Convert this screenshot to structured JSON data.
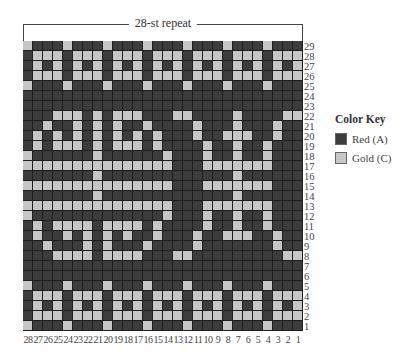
{
  "title": "28-st repeat",
  "colors": {
    "D": "#3c3c3c",
    "L": "#c6c6c6"
  },
  "key": {
    "title": "Color Key",
    "items": [
      {
        "code": "D",
        "label": "Red (A)",
        "color": "#3c3c3c"
      },
      {
        "code": "L",
        "label": "Gold (C)",
        "color": "#c6c6c6"
      }
    ]
  },
  "column_labels": [
    "28",
    "27",
    "26",
    "25",
    "24",
    "23",
    "22",
    "21",
    "20",
    "19",
    "18",
    "17",
    "16",
    "15",
    "14",
    "13",
    "12",
    "11",
    "10",
    "9",
    "8",
    "7",
    "6",
    "5",
    "4",
    "3",
    "2",
    "1"
  ],
  "rows": [
    {
      "num": "29",
      "cells": "LDDDLDDDLDDDLDDDLDDDLDDDLDDD"
    },
    {
      "num": "28",
      "cells": "DLLLDLLLDLLLDLLLDLLLDLLLDLLL"
    },
    {
      "num": "27",
      "cells": "DLDLDLDLDLDLDLDLDLDLDLDLDLDL"
    },
    {
      "num": "26",
      "cells": "DLLLDLLLDLLLDLLLDLLLDLLLDLLL"
    },
    {
      "num": "25",
      "cells": "LDDDLDDDLDDDLDDDLDDDLDDDLDDD"
    },
    {
      "num": "24",
      "cells": "DDDDDDDDDDDDDDDDDDDDDDDDDDDD"
    },
    {
      "num": "23",
      "cells": "DDDDDDDDDDDDDDDDDDDDDDDDDDDD"
    },
    {
      "num": "22",
      "cells": "DDDLLLDLDLLLDDDLLDDDDLDDDDLL"
    },
    {
      "num": "21",
      "cells": "DDLDDLDLDLDDLDDDDLDDDLDDDLDD"
    },
    {
      "num": "20",
      "cells": "DLDLDLDLDLDLDLDDDLDDLLLDDLDD"
    },
    {
      "num": "19",
      "cells": "DLDLLLDLDLLLDLDDDDLDDLDDLDDD"
    },
    {
      "num": "18",
      "cells": "LDDDDDDLDDDDDDLDDDLDDLDDLDDD"
    },
    {
      "num": "17",
      "cells": "LLLLLLLLLLLLLLLDDDLLLLLLLDDD"
    },
    {
      "num": "16",
      "cells": "DDDDDDDLDDDDDDDDDDDDDLDDDDDD"
    },
    {
      "num": "15",
      "cells": "LLLLLLLLLLLLLLLDDDLLLLLLLDDD"
    },
    {
      "num": "14",
      "cells": "DDDDDDDLDDDDDDDDDDDDDLDDDDDD"
    },
    {
      "num": "13",
      "cells": "LLLLLLLLLLLLLLLDDDLLLLLLLDDD"
    },
    {
      "num": "12",
      "cells": "LDDDDDDDDDDDDDLDDDLDDLDDLDDD"
    },
    {
      "num": "11",
      "cells": "DLDLLLLDLLLLDLDDDDLDDLDDLDDD"
    },
    {
      "num": "10",
      "cells": "DLDDLDLDLDLDDLDDDLDDLLLDDLDD"
    },
    {
      "num": "9",
      "cells": "DDLDDDLDLDDDLDDDDLDDDDDDDLDD"
    },
    {
      "num": "8",
      "cells": "DDDLLLLDLLLLDDDLLDDDDDDDDDLL"
    },
    {
      "num": "7",
      "cells": "DDDDDDDDDDDDDDDDDDDDDDDDDDDD"
    },
    {
      "num": "6",
      "cells": "DDDDDDDDDDDDDDDDDDDDDDDDDDDD"
    },
    {
      "num": "5",
      "cells": "LDDDLDDDLDDDLDDDLDDDLDDDLDDD"
    },
    {
      "num": "4",
      "cells": "DLLLDLLLDLLLDLLLDLLLDLLLDLLL"
    },
    {
      "num": "3",
      "cells": "DLDLDLDLDLDLDLDLDLDLDLDLDLDL"
    },
    {
      "num": "2",
      "cells": "DLLLDLLLDLLLDLLLDLLLDLLLDLLL"
    },
    {
      "num": "1",
      "cells": "LDDDLDDDLDDDLDDDLDDDLDDDLDDD"
    }
  ]
}
